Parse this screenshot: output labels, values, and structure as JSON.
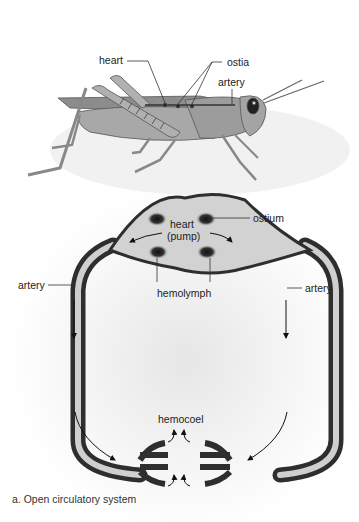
{
  "figure": {
    "caption": "a. Open circulatory system",
    "grasshopper_labels": {
      "heart": "heart",
      "ostia": "ostia",
      "artery": "artery"
    },
    "schematic_labels": {
      "heart_line1": "heart",
      "heart_line2": "(pump)",
      "ostium": "ostium",
      "artery_left": "artery",
      "artery_right": "artery",
      "hemolymph": "hemolymph",
      "hemocoel": "hemocoel"
    },
    "colors": {
      "ink": "#222222",
      "vessel_dark": "#3a3a3a",
      "vessel_light": "#d8d8d8",
      "body": "#9a9a9a"
    }
  }
}
